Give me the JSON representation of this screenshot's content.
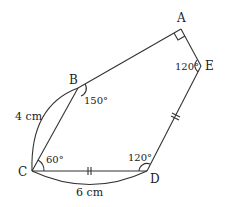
{
  "diagram": {
    "type": "geometry-figure",
    "points": {
      "A": {
        "label": "A",
        "x": 181,
        "y": 29
      },
      "E": {
        "label": "E",
        "x": 201,
        "y": 66
      },
      "B": {
        "label": "B",
        "x": 78,
        "y": 88
      },
      "C": {
        "label": "C",
        "x": 32,
        "y": 171
      },
      "D": {
        "label": "D",
        "x": 147,
        "y": 171
      }
    },
    "angles": {
      "A": "",
      "E": "120°",
      "B": "150°",
      "C": "60°",
      "D": "120°"
    },
    "lengths": {
      "BC": "4 cm",
      "CD": "6 cm"
    },
    "marks": {
      "right_angle_at": "A",
      "equal_sides": [
        "CD",
        "DE"
      ]
    }
  }
}
